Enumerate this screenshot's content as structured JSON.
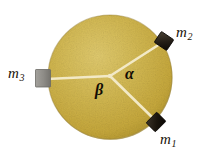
{
  "figure": {
    "type": "physics-diagram",
    "background_color": "#ffffff",
    "disk": {
      "name": "uniform-disk",
      "fill_color": "#c9ab3f",
      "highlight_color": "#ddc766",
      "shadow_color": "#a98d2e",
      "edge_color": "#8d7422",
      "center_x": 110,
      "center_y": 77,
      "radius": 62,
      "texture": "mottled-grainy"
    },
    "spokes": {
      "color": "#efe5c0",
      "width": 2.4,
      "items": [
        {
          "name": "spoke-to-m1",
          "angle_deg": -44,
          "to_x": 155,
          "to_y": 120
        },
        {
          "name": "spoke-to-m2",
          "angle_deg": 33,
          "to_x": 162,
          "to_y": 43
        },
        {
          "name": "spoke-to-m3",
          "angle_deg": 182,
          "to_x": 48,
          "to_y": 79
        }
      ]
    },
    "masses": [
      {
        "id": "m1",
        "label": "m",
        "subscript": "1",
        "color": "#231c14",
        "edge_color": "#0d0a06",
        "x": 155,
        "y": 122,
        "width": 15,
        "height": 13,
        "rotation_deg": -45,
        "position_note": "lower-right rim of disk"
      },
      {
        "id": "m2",
        "label": "m",
        "subscript": "2",
        "color": "#2a241b",
        "edge_color": "#100c07",
        "x": 164,
        "y": 41,
        "width": 15,
        "height": 13,
        "rotation_deg": 35,
        "position_note": "upper-right rim of disk"
      },
      {
        "id": "m3",
        "label": "m",
        "subscript": "3",
        "color": "#8f8d88",
        "edge_color": "#6e6c67",
        "x": 43,
        "y": 78,
        "width": 15,
        "height": 17,
        "rotation_deg": 0,
        "position_note": "left rim of disk"
      }
    ],
    "angles": [
      {
        "id": "alpha",
        "symbol": "α",
        "between": "spoke-to-m2 and spoke-to-m1",
        "x": 125,
        "y": 66
      },
      {
        "id": "beta",
        "symbol": "β",
        "between": "spoke-to-m3 and spoke-to-m1",
        "x": 95,
        "y": 82
      }
    ]
  }
}
